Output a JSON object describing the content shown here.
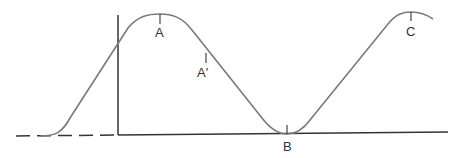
{
  "diagram": {
    "type": "wave-over-baseline",
    "colors": {
      "axis": "#333333",
      "curve": "#7a7a7a",
      "label": "#333333"
    },
    "labels": {
      "A": "A",
      "A_prime": "A′",
      "B": "B",
      "C": "C"
    },
    "points": {
      "A": {
        "x": 160,
        "y": 15
      },
      "A_prime": {
        "x": 206,
        "y": 52
      },
      "B": {
        "x": 287,
        "y": 134
      },
      "C": {
        "x": 411,
        "y": 12
      }
    }
  }
}
